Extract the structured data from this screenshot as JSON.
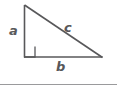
{
  "figure": {
    "width": 117,
    "height": 93,
    "background_color": "#ffffff",
    "stroke_color": "#58585a",
    "label_color": "#58585a",
    "rule_color": "#9a9a9c"
  },
  "labels": {
    "leg_vertical": "a",
    "leg_horizontal": "b",
    "hypotenuse": "c"
  },
  "geometry": {
    "type": "right-triangle",
    "vertices": {
      "apex": [
        24,
        5
      ],
      "right_angle": [
        24,
        57
      ],
      "base_right": [
        102,
        57
      ]
    },
    "right_angle_marker": {
      "x": 24,
      "y": 46,
      "size": 11
    },
    "sides": [
      {
        "name": "a",
        "from": "apex",
        "to": "right_angle",
        "role": "vertical-leg"
      },
      {
        "name": "b",
        "from": "right_angle",
        "to": "base_right",
        "role": "horizontal-leg"
      },
      {
        "name": "c",
        "from": "apex",
        "to": "base_right",
        "role": "hypotenuse"
      }
    ]
  },
  "divider": {
    "y": 84,
    "x_start": 0,
    "x_end": 117
  }
}
